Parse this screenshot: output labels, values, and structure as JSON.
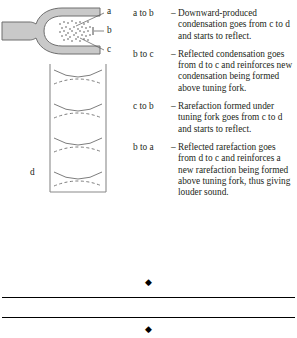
{
  "figures": {
    "fork": {
      "name": "tuning-fork-diagram",
      "fill_color": "#c9c9c9",
      "stroke_color": "#6e6e6e",
      "labels": [
        {
          "id": "a",
          "text": "a"
        },
        {
          "id": "b",
          "text": "b"
        },
        {
          "id": "c",
          "text": "c"
        }
      ]
    },
    "tube": {
      "name": "resonance-tube-diagram",
      "stroke_color": "#8a8a8a",
      "label": "d",
      "wave_pairs": 4
    }
  },
  "explanations": [
    {
      "key": "a to b",
      "dash": "–",
      "text": "Downward-produced condensation goes from c to d and starts to reflect."
    },
    {
      "key": "b to c",
      "dash": "–",
      "text": "Reflected condensation goes from d to c and reinforces new condensation being formed above tuning fork."
    },
    {
      "key": "c to b",
      "dash": "–",
      "text": "Rarefaction formed under tuning fork goes from c to d and starts to reflect."
    },
    {
      "key": "b to a",
      "dash": "–",
      "text": "Reflected rarefaction goes from d to c and reinforces a new rarefaction being formed above tuning fork, thus giving louder sound."
    }
  ],
  "ornaments": {
    "top_glyph": "◆",
    "bottom_glyph": "◆"
  }
}
